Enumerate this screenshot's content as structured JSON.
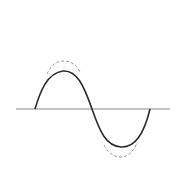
{
  "diagram": {
    "colors": {
      "background": "#ffffff",
      "axis": "#8a8a8a",
      "solid_wave": "#2a2a2a",
      "dashed_wave": "#9a9a9a"
    },
    "axis": {
      "y": 109,
      "x_start": 16,
      "x_end": 170
    },
    "solid_wave": {
      "x_start": 35,
      "x_cross": 92,
      "x_end": 150,
      "peak_y": 71,
      "trough_y": 147
    },
    "dashed_wave": {
      "peak_y": 62,
      "trough_y": 156
    }
  }
}
